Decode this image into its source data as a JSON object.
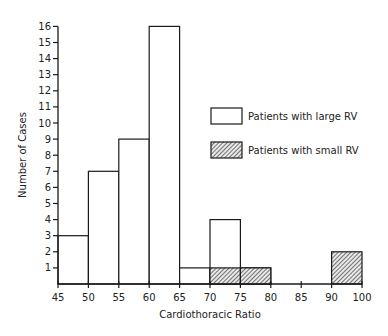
{
  "chart_data": {
    "type": "bar",
    "subtype": "histogram",
    "title": "",
    "xlabel": "Cardiothoracic Ratio",
    "ylabel": "Number of Cases",
    "xlim": [
      45,
      100
    ],
    "ylim": [
      0,
      16
    ],
    "x_ticks": [
      45,
      50,
      55,
      60,
      65,
      70,
      75,
      80,
      85,
      90,
      100
    ],
    "x_tick_positions": [
      45,
      50,
      55,
      60,
      65,
      70,
      75,
      80,
      85,
      90,
      95
    ],
    "y_ticks": [
      1,
      2,
      3,
      4,
      5,
      6,
      7,
      8,
      9,
      10,
      11,
      12,
      13,
      14,
      15,
      16
    ],
    "grid": false,
    "legend_position": "right-middle",
    "series": [
      {
        "name": "Patients with large RV",
        "fill": "open",
        "bins": [
          {
            "start": 45,
            "end": 50,
            "value": 3
          },
          {
            "start": 50,
            "end": 55,
            "value": 7
          },
          {
            "start": 55,
            "end": 60,
            "value": 9
          },
          {
            "start": 60,
            "end": 65,
            "value": 16
          },
          {
            "start": 65,
            "end": 70,
            "value": 1
          },
          {
            "start": 70,
            "end": 75,
            "value": 4
          },
          {
            "start": 75,
            "end": 80,
            "value": 1
          }
        ]
      },
      {
        "name": "Patients with small RV",
        "fill": "hatched",
        "bins": [
          {
            "start": 70,
            "end": 75,
            "value": 1
          },
          {
            "start": 75,
            "end": 80,
            "value": 1
          },
          {
            "start": 90,
            "end": 95,
            "value": 2
          }
        ]
      }
    ]
  },
  "legend": {
    "items": [
      {
        "label": "Patients with large RV",
        "style": "open"
      },
      {
        "label": "Patients with small RV",
        "style": "hatched"
      }
    ]
  },
  "axes": {
    "x_label": "Cardiothoracic Ratio",
    "y_label": "Number of Cases"
  }
}
